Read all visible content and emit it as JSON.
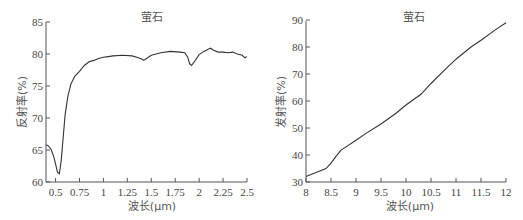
{
  "chart_data": [
    {
      "type": "line",
      "title": "萤石",
      "xlabel": "波长(μm)",
      "ylabel": "反射率(%)",
      "xlim": [
        0.4,
        2.5
      ],
      "ylim": [
        60,
        85
      ],
      "x_ticks": [
        "0.5",
        "0.75",
        "1",
        "1.25",
        "1.5",
        "1.75",
        "2",
        "2.25",
        "2.5"
      ],
      "y_ticks": [
        "60",
        "65",
        "70",
        "75",
        "80",
        "85"
      ],
      "grid": false,
      "series": [
        {
          "name": "萤石 VNIR-SWIR",
          "x": [
            0.4,
            0.42,
            0.45,
            0.48,
            0.5,
            0.52,
            0.54,
            0.56,
            0.58,
            0.6,
            0.63,
            0.66,
            0.7,
            0.75,
            0.8,
            0.85,
            0.9,
            0.95,
            1.0,
            1.05,
            1.1,
            1.2,
            1.3,
            1.35,
            1.4,
            1.42,
            1.45,
            1.5,
            1.55,
            1.6,
            1.7,
            1.8,
            1.85,
            1.88,
            1.9,
            1.92,
            1.95,
            2.0,
            2.05,
            2.1,
            2.12,
            2.15,
            2.2,
            2.25,
            2.3,
            2.35,
            2.4,
            2.45,
            2.48,
            2.5
          ],
          "y": [
            65.8,
            65.7,
            65.2,
            64.0,
            62.8,
            61.5,
            61.3,
            63.5,
            67.0,
            70.5,
            73.5,
            75.3,
            76.5,
            77.3,
            78.2,
            78.8,
            79.0,
            79.3,
            79.5,
            79.6,
            79.7,
            79.8,
            79.7,
            79.5,
            79.2,
            79.0,
            79.3,
            79.8,
            80.0,
            80.2,
            80.4,
            80.3,
            80.2,
            79.5,
            78.5,
            78.2,
            78.8,
            79.9,
            80.4,
            80.8,
            80.9,
            80.6,
            80.3,
            80.3,
            80.2,
            80.3,
            80.0,
            79.8,
            79.4,
            79.6
          ]
        }
      ]
    },
    {
      "type": "line",
      "title": "萤石",
      "xlabel": "波长(μm)",
      "ylabel": "发射率(%)",
      "xlim": [
        8,
        12
      ],
      "ylim": [
        30,
        90
      ],
      "x_ticks": [
        "8",
        "8.5",
        "9",
        "9.5",
        "10",
        "10.5",
        "11",
        "11.5",
        "12"
      ],
      "y_ticks": [
        "30",
        "40",
        "50",
        "60",
        "70",
        "80",
        "90"
      ],
      "grid": false,
      "series": [
        {
          "name": "萤石 TIR",
          "x": [
            8.0,
            8.2,
            8.4,
            8.5,
            8.6,
            8.7,
            8.8,
            9.0,
            9.2,
            9.5,
            9.8,
            10.0,
            10.3,
            10.5,
            10.8,
            11.0,
            11.3,
            11.5,
            11.8,
            12.0
          ],
          "y": [
            32.0,
            33.5,
            35.0,
            37.0,
            39.5,
            41.8,
            43.0,
            45.5,
            48.0,
            51.5,
            55.5,
            58.5,
            62.5,
            66.5,
            72.0,
            75.5,
            80.0,
            82.5,
            86.5,
            89.0
          ]
        }
      ]
    }
  ]
}
